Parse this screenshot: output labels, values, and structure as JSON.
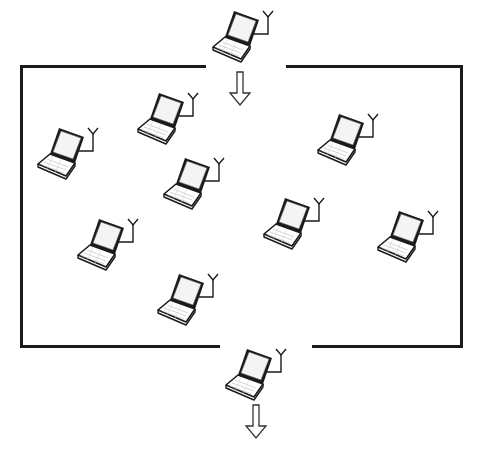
{
  "diagram": {
    "type": "network-cell",
    "colors": {
      "stroke": "#1a1a1a",
      "screen_fill": "#f4f4f4",
      "keyboard_fill": "#ffffff",
      "background": "#ffffff"
    },
    "boundary": {
      "left": 21,
      "right": 461,
      "top": 66,
      "bottom": 346,
      "top_gap": [
        206,
        286
      ],
      "bottom_gap": [
        220,
        312
      ]
    },
    "entering_node": {
      "id": "incoming",
      "x": 210,
      "y": 8
    },
    "leaving_node": {
      "id": "outgoing",
      "x": 223,
      "y": 346
    },
    "arrows": [
      {
        "id": "enter-arrow",
        "direction": "down",
        "x": 228,
        "y": 71
      },
      {
        "id": "exit-arrow",
        "direction": "down",
        "x": 244,
        "y": 404
      }
    ],
    "nodes_inside": [
      {
        "id": "n1",
        "x": 135,
        "y": 90
      },
      {
        "id": "n2",
        "x": 35,
        "y": 125
      },
      {
        "id": "n3",
        "x": 315,
        "y": 111
      },
      {
        "id": "n4",
        "x": 161,
        "y": 155
      },
      {
        "id": "n5",
        "x": 261,
        "y": 195
      },
      {
        "id": "n6",
        "x": 375,
        "y": 208
      },
      {
        "id": "n7",
        "x": 75,
        "y": 216
      },
      {
        "id": "n8",
        "x": 155,
        "y": 271
      }
    ]
  }
}
